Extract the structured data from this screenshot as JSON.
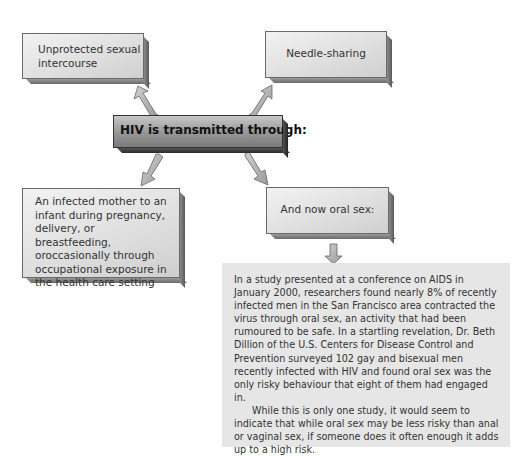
{
  "diagram": {
    "center": {
      "label": "HIV is transmitted through:"
    },
    "nodes": [
      {
        "id": "unprotected",
        "label": "Unprotected sexual intercourse",
        "lines": [
          "Unprotected sexual",
          "intercourse"
        ]
      },
      {
        "id": "needle",
        "label": "Needle-sharing"
      },
      {
        "id": "mother",
        "lines": [
          "An infected mother to an",
          "infant during pregnancy,",
          "delivery, or breastfeeding,",
          "oroccasionally through",
          "occupational exposure in",
          "the health care setting"
        ]
      },
      {
        "id": "oral",
        "label": "And now oral sex:"
      }
    ],
    "arrow_color": "#b5b5b5"
  },
  "panel": {
    "paragraph1": "In a study presented at a conference on AIDS in January 2000, researchers found nearly 8% of recently infected men in the San Francisco area contracted the virus through oral sex, an activity that had been rumoured to be safe. In a startling revelation, Dr. Beth Dillion of the U.S. Centers for Disease Control and Prevention surveyed 102 gay and bisexual men recently infected with HIV and found oral sex was the only risky behaviour that eight of them had engaged in.",
    "paragraph2": "While this is only one study, it would seem to indicate that while oral sex may be less risky than anal or vaginal sex, if someone does it often enough it adds up to a high risk."
  }
}
